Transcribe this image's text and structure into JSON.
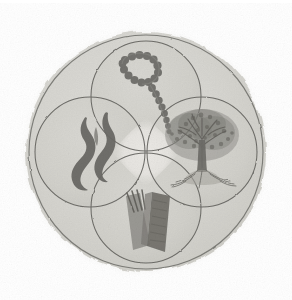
{
  "figure": {
    "title": "Four-symbol circular emblem",
    "medium_note": "grayscale scanned ink drawing",
    "background_color": "#ffffff"
  },
  "palette": {
    "page_background": "#ffffff",
    "disc_halo": "#e7e6e2",
    "disc_fill": "#d9d8d3",
    "inner_circle_fill": "#d2d1cb",
    "center_gap_fill": "#e9e8e4",
    "ring_line": "#6f6e6a",
    "circle_line": "#5f5e5a",
    "motif_dark": "#6b6a66",
    "motif_mid": "#8a8984",
    "motif_light": "#a3a29d"
  },
  "geometry": {
    "canvas_width": 292,
    "canvas_height": 300,
    "disc_center_x": 146,
    "disc_center_y": 152,
    "disc_radius": 126,
    "outer_ring_radius": 118,
    "inner_circle_radius": 55,
    "inner_circle_offset": 56
  },
  "emblem": {
    "name": "quadripartite-roundel",
    "outer_ring_label": "outer ring",
    "quadrants": [
      {
        "position": "top",
        "name": "beaded-chain",
        "label": "Beaded chain / rosary loop",
        "center_x": 146,
        "center_y": 96,
        "bead_count": 22
      },
      {
        "position": "left",
        "name": "flame",
        "label": "Flame / smoke tendrils",
        "center_x": 90,
        "center_y": 152,
        "tendril_count": 2
      },
      {
        "position": "right",
        "name": "tree",
        "label": "Tree with exposed roots",
        "center_x": 202,
        "center_y": 152,
        "branch_count": 9
      },
      {
        "position": "bottom",
        "name": "open-book",
        "label": "Open book with quill strokes",
        "center_x": 146,
        "center_y": 208,
        "page_count": 2,
        "stroke_count": 4
      }
    ]
  }
}
